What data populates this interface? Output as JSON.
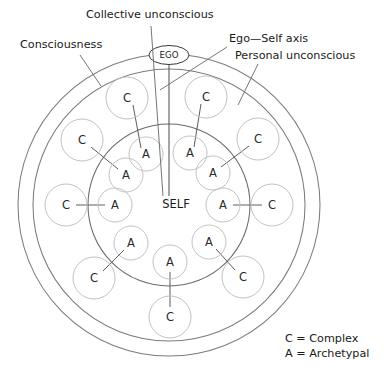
{
  "figure": {
    "center": {
      "x": 169,
      "y": 205
    },
    "rings": [
      {
        "name": "consciousness-outer-boundary",
        "r": 151
      },
      {
        "name": "personal-unconscious-boundary",
        "r": 136
      },
      {
        "name": "collective-unconscious-boundary",
        "r": 81
      }
    ]
  },
  "labels": {
    "consciousness": "Consciousness",
    "collective_unconscious": "Collective unconscious",
    "ego_self_axis": "Ego—Self axis",
    "personal_unconscious": "Personal unconscious",
    "ego": "EGO",
    "self": "SELF"
  },
  "legend": {
    "complex": "C = Complex",
    "archetypal": "A = Archetypal"
  },
  "node_labels": {
    "complex": "C",
    "archetypal": "A"
  },
  "colors": {
    "background": "#ffffff",
    "ring_stroke": "#7c7c7c",
    "node_stroke": "#c2c2c2",
    "connector_stroke": "#5c5c5c",
    "text": "#1a1a1a"
  },
  "node_pairs": [
    {
      "id": "pair-1",
      "angle_deg": -112,
      "complex": {
        "label": "C",
        "x": 127,
        "y": 98,
        "r": 21
      },
      "archetypal": {
        "label": "A",
        "x": 146,
        "y": 154,
        "r": 17
      }
    },
    {
      "id": "pair-2",
      "angle_deg": -68,
      "complex": {
        "label": "C",
        "x": 206,
        "y": 97,
        "r": 21
      },
      "archetypal": {
        "label": "A",
        "x": 190,
        "y": 153,
        "r": 17
      }
    },
    {
      "id": "pair-3",
      "angle_deg": -157,
      "complex": {
        "label": "C",
        "x": 82,
        "y": 140,
        "r": 21
      },
      "archetypal": {
        "label": "A",
        "x": 126,
        "y": 175,
        "r": 17
      }
    },
    {
      "id": "pair-4",
      "angle_deg": -23,
      "complex": {
        "label": "C",
        "x": 258,
        "y": 139,
        "r": 21
      },
      "archetypal": {
        "label": "A",
        "x": 213,
        "y": 173,
        "r": 17
      }
    },
    {
      "id": "pair-5",
      "angle_deg": 180,
      "complex": {
        "label": "C",
        "x": 66,
        "y": 205,
        "r": 21
      },
      "archetypal": {
        "label": "A",
        "x": 115,
        "y": 205,
        "r": 17
      }
    },
    {
      "id": "pair-6",
      "angle_deg": 0,
      "complex": {
        "label": "C",
        "x": 272,
        "y": 205,
        "r": 21
      },
      "archetypal": {
        "label": "A",
        "x": 223,
        "y": 205,
        "r": 17
      }
    },
    {
      "id": "pair-7",
      "angle_deg": 157,
      "complex": {
        "label": "C",
        "x": 94,
        "y": 278,
        "r": 21
      },
      "archetypal": {
        "label": "A",
        "x": 131,
        "y": 243,
        "r": 17
      }
    },
    {
      "id": "pair-8",
      "angle_deg": 23,
      "complex": {
        "label": "C",
        "x": 243,
        "y": 277,
        "r": 21
      },
      "archetypal": {
        "label": "A",
        "x": 209,
        "y": 242,
        "r": 17
      }
    },
    {
      "id": "pair-9",
      "angle_deg": 90,
      "complex": {
        "label": "C",
        "x": 170,
        "y": 317,
        "r": 21
      },
      "archetypal": {
        "label": "A",
        "x": 170,
        "y": 262,
        "r": 17
      }
    }
  ],
  "callouts": [
    {
      "name": "consciousness",
      "text": "Consciousness",
      "text_x": 20,
      "text_y": 48,
      "anchor": "start",
      "line": {
        "x1": 80,
        "y1": 55,
        "x2": 101,
        "y2": 86
      }
    },
    {
      "name": "collective-unconscious",
      "text": "Collective unconscious",
      "text_x": 86,
      "text_y": 18,
      "anchor": "start",
      "line": {
        "x1": 151,
        "y1": 26,
        "x2": 163,
        "y2": 196
      }
    },
    {
      "name": "ego-self-axis",
      "text": "Ego—Self axis",
      "text_x": 229,
      "text_y": 42,
      "anchor": "start",
      "line": {
        "x1": 227,
        "y1": 47,
        "x2": 160,
        "y2": 90
      }
    },
    {
      "name": "personal-unconscious",
      "text": "Personal unconscious",
      "text_x": 235,
      "text_y": 59,
      "anchor": "start",
      "line": {
        "x1": 258,
        "y1": 64,
        "x2": 238,
        "y2": 105
      }
    }
  ]
}
